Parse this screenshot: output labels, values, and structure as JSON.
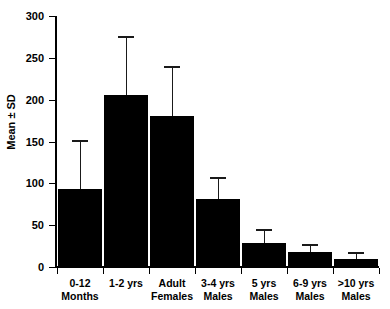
{
  "chart_data": {
    "type": "bar",
    "title": "",
    "xlabel": "",
    "ylabel": "Mean ± SD",
    "ylim": [
      0,
      300
    ],
    "yticks": [
      0,
      50,
      100,
      150,
      200,
      250,
      300
    ],
    "ytick_labels": [
      "0",
      "50",
      "100",
      "150",
      "200",
      "250",
      "300"
    ],
    "grid": false,
    "legend": "none",
    "bar_color": "#000000",
    "error_bar_style": "upper-only",
    "categories": [
      "0-12 Months",
      "1-2 yrs",
      "Adult Females",
      "3-4 yrs Males",
      "5 yrs Males",
      "6-9 yrs Males",
      ">10 yrs Males"
    ],
    "category_lines": [
      [
        "0-12",
        "Months"
      ],
      [
        "1-2 yrs",
        ""
      ],
      [
        "Adult",
        "Females"
      ],
      [
        "3-4 yrs",
        "Males"
      ],
      [
        "5 yrs",
        "Males"
      ],
      [
        "6-9 yrs",
        "Males"
      ],
      [
        ">10 yrs",
        "Males"
      ]
    ],
    "values": [
      93,
      205,
      180,
      81,
      29,
      18,
      10
    ],
    "errors": [
      59,
      71,
      60,
      26,
      17,
      10,
      8
    ],
    "upper_bounds": [
      152,
      276,
      240,
      107,
      46,
      28,
      18
    ]
  }
}
